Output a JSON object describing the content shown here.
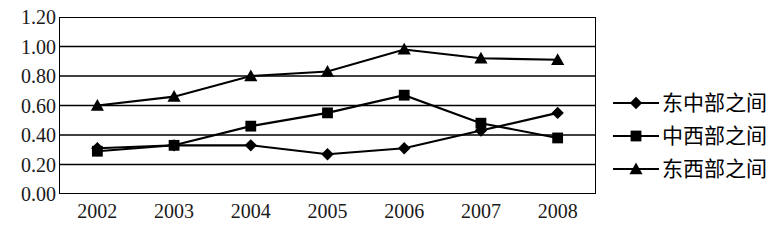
{
  "chart_data": {
    "type": "line",
    "title": "",
    "xlabel": "",
    "ylabel": "",
    "categories": [
      "2002",
      "2003",
      "2004",
      "2005",
      "2006",
      "2007",
      "2008"
    ],
    "ylim": [
      0.0,
      1.2
    ],
    "yticks": [
      "0.00",
      "0.20",
      "0.40",
      "0.60",
      "0.80",
      "1.00",
      "1.20"
    ],
    "ytick_values": [
      0.0,
      0.2,
      0.4,
      0.6,
      0.8,
      1.0,
      1.2
    ],
    "grid": "horizontal",
    "legend_position": "right",
    "series": [
      {
        "name": "东中部之间",
        "marker": "diamond",
        "color": "#000000",
        "values": [
          0.31,
          0.33,
          0.33,
          0.27,
          0.31,
          0.43,
          0.55
        ]
      },
      {
        "name": "中西部之间",
        "marker": "square",
        "color": "#000000",
        "values": [
          0.29,
          0.33,
          0.46,
          0.55,
          0.67,
          0.48,
          0.38
        ]
      },
      {
        "name": "东西部之间",
        "marker": "triangle",
        "color": "#000000",
        "values": [
          0.6,
          0.66,
          0.8,
          0.83,
          0.98,
          0.92,
          0.91
        ]
      }
    ]
  },
  "legend": {
    "items": [
      {
        "label": "东中部之间",
        "marker": "diamond"
      },
      {
        "label": "中西部之间",
        "marker": "square"
      },
      {
        "label": "东西部之间",
        "marker": "triangle"
      }
    ]
  }
}
